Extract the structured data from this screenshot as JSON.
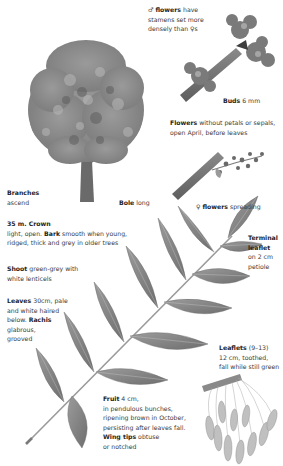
{
  "colors": {
    "ink": "#2b2b2b",
    "label": "#3a3a3a",
    "leaf": "#8a8a8a",
    "bark": "#6f6f6f",
    "background": "#ffffff"
  },
  "labels": {
    "male_flowers": {
      "symbol": "♂",
      "bold": "flowers",
      "text1": " have",
      "line2": "stamens set more",
      "line3a": "densely than ",
      "line3b": "♀",
      "line3c": "s"
    },
    "buds": {
      "bold": "Buds",
      "text": " 6 mm"
    },
    "flowers": {
      "bold": "Flowers",
      "text": " without petals or sepals,",
      "line2": "open April, before leaves"
    },
    "female_flowers": {
      "symbol": "♀",
      "bold": "flowers",
      "text": " spreading"
    },
    "branches": {
      "bold": "Branches",
      "line2": "ascend"
    },
    "bole": {
      "bold": "Bole",
      "text": " long"
    },
    "crown": {
      "bold": "35 m. Crown",
      "line2a": "light, open. ",
      "line2b": "Bark",
      "line2c": " smooth when young,",
      "line3": "ridged, thick and grey in older trees"
    },
    "shoot": {
      "bold": "Shoot",
      "text": " green-grey with",
      "line2": "white lenticels"
    },
    "leaves": {
      "bold": "Leaves",
      "text": " 30cm, pale",
      "line2": "and white haired",
      "line3a": "below. ",
      "line3b": "Rachis",
      "line4": "glabrous,",
      "line5": "grooved"
    },
    "terminal": {
      "bold1": "Terminal",
      "bold2": "leaflet",
      "line3": "on 2 cm",
      "line4": "petiole"
    },
    "leaflets": {
      "bold": "Leaflets",
      "text": " (9–13)",
      "line2": "12 cm, toothed,",
      "line3": "fall while still green"
    },
    "fruit": {
      "bold": "Fruit",
      "text": " 4 cm,",
      "line2": "in pendulous bunches,",
      "line3": "ripening brown in October,",
      "line4": "persisting after leaves fall.",
      "line5a": "Wing tips",
      "line5b": " obtuse",
      "line6": "or notched"
    }
  },
  "illustrations": [
    "tree-illustration",
    "bud-twig-illustration",
    "female-flower-twig-illustration",
    "compound-leaf-illustration",
    "fruit-cluster-illustration"
  ]
}
